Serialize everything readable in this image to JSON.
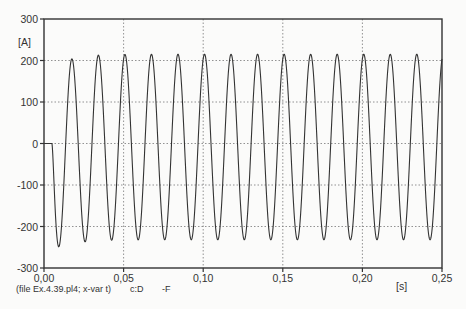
{
  "chart_data": {
    "type": "line",
    "title": "",
    "xlabel": "[s]",
    "ylabel": "[A]",
    "xlim": [
      0,
      0.25
    ],
    "ylim": [
      -300,
      300
    ],
    "x_ticks": [
      "0,00",
      "0,05",
      "0,10",
      "0,15",
      "0,20",
      "0,25"
    ],
    "y_ticks": [
      "300",
      "200",
      "100",
      "0",
      "-100",
      "-200",
      "-300"
    ],
    "grid": "dotted",
    "legend": null,
    "series": [
      {
        "name": "c:D -F",
        "description": "AC current transient: zero until ~0.005 s, first trough ~-290 A at ~0.012 s, then ~60 Hz oscillation with peaks ~205-220 A and troughs ~-230 A",
        "frequency_hz": 60,
        "start_time": 0.005,
        "first_trough": -290,
        "peak_approx": 215,
        "trough_approx": -232,
        "color": "#333333"
      }
    ]
  },
  "caption": {
    "file": "(file Ex.4.39.pl4; x-var t)",
    "var1": "c:D",
    "var2": "-F"
  },
  "axis": {
    "x_unit": "[s]",
    "y_unit": "[A]"
  }
}
